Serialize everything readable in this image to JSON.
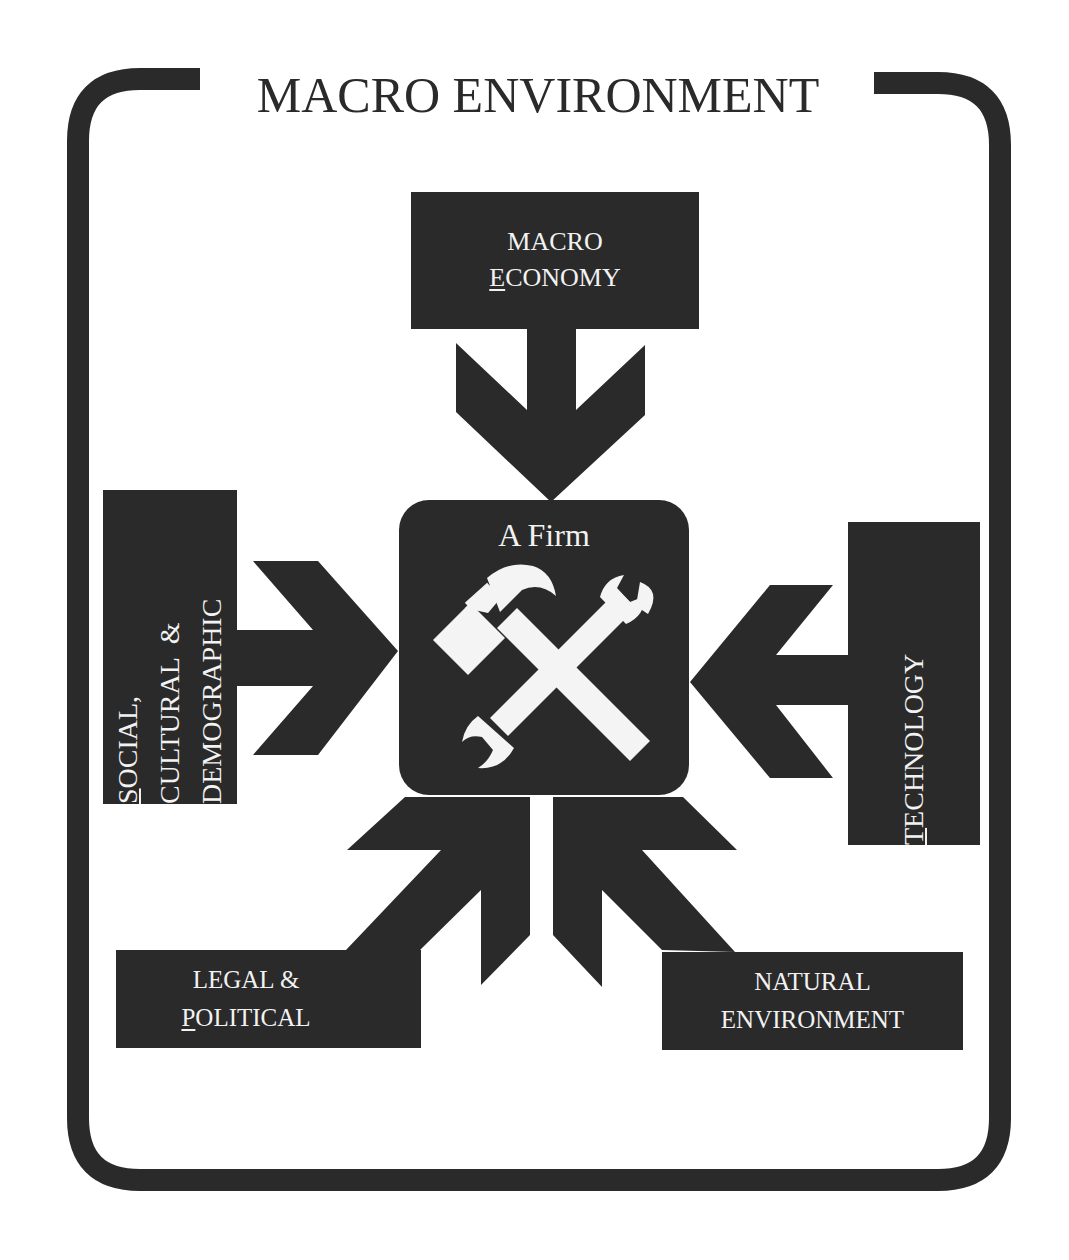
{
  "title": "MACRO ENVIRONMENT",
  "center": {
    "label": "A Firm",
    "icon": "hammer-and-wrench-icon"
  },
  "forces": {
    "top": {
      "line1": "MACRO",
      "line2_underlined": "E",
      "line2_rest": "CONOMY"
    },
    "left": {
      "line1_underlined": "S",
      "line1_rest": "OCIAL,",
      "line2": "CULTURAL  &",
      "line3": "DEMOGRAPHIC"
    },
    "right": {
      "underlined": "T",
      "rest": "ECHNOLOGY"
    },
    "bottom_left": {
      "line1": "LEGAL &",
      "line2_underlined": "P",
      "line2_rest": "OLITICAL"
    },
    "bottom_right": {
      "line1": "NATURAL",
      "line2": "ENVIRONMENT"
    }
  },
  "colors": {
    "fill": "#2a2a2a",
    "text_on_fill": "#f2f2f2",
    "background": "#ffffff"
  }
}
